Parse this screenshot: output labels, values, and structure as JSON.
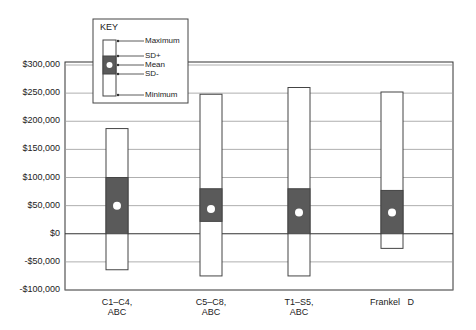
{
  "chart_data": {
    "type": "box",
    "title": "",
    "xlabel": "",
    "ylabel": "",
    "ylim": [
      -100000,
      300000
    ],
    "grid": true,
    "y_ticks": [
      "$300,000",
      "$250,000",
      "$200,000",
      "$150,000",
      "$100,000",
      "$50,000",
      "$0",
      "-$50,000",
      "-$100,000"
    ],
    "y_tick_values": [
      300000,
      250000,
      200000,
      150000,
      100000,
      50000,
      0,
      -50000,
      -100000
    ],
    "categories": [
      "C1–C4, ABC",
      "C5–C8, ABC",
      "T1–S5, ABC",
      "Frankel D"
    ],
    "category_lines": [
      [
        "C1–C4,",
        "ABC"
      ],
      [
        "C5–C8,",
        "ABC"
      ],
      [
        "T1–S5,",
        "ABC"
      ],
      [
        "Frankel   D",
        ""
      ]
    ],
    "series": [
      {
        "name": "Maximum",
        "values": [
          187000,
          248000,
          260000,
          252000
        ]
      },
      {
        "name": "SD+",
        "values": [
          100000,
          80000,
          80000,
          77000
        ]
      },
      {
        "name": "Mean",
        "values": [
          50000,
          44000,
          38000,
          38000
        ]
      },
      {
        "name": "SD-",
        "values": [
          0,
          22000,
          0,
          0
        ]
      },
      {
        "name": "Minimum",
        "values": [
          -64000,
          -75000,
          -75000,
          -26000
        ]
      }
    ],
    "legend": {
      "title": "KEY",
      "position": "top-left",
      "entries": [
        "Maximum",
        "SD+",
        "Mean",
        "SD-",
        "Minimum"
      ]
    }
  },
  "colors": {
    "sd_fill": "#5a5a5a",
    "box_fill": "#ffffff",
    "grid": "#9a9a9a",
    "axis": "#333333",
    "mean_marker": "#ffffff"
  }
}
